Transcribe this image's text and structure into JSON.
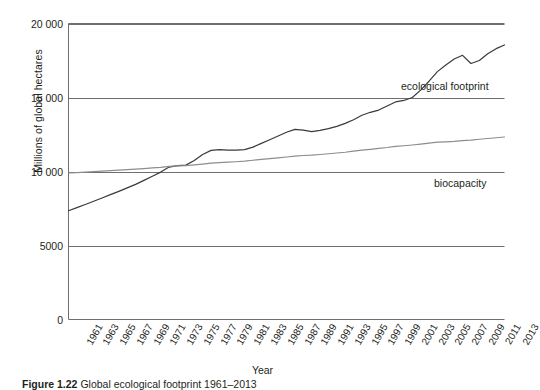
{
  "figure": {
    "caption_prefix": "Figure 1.22",
    "caption_text": "Global ecological footprint 1961–2013",
    "background": "#ffffff"
  },
  "chart_data": {
    "type": "line",
    "title": "",
    "xlabel": "Year",
    "ylabel": "Millions of global hectares",
    "xlim": [
      1961,
      2013
    ],
    "ylim": [
      0,
      20000
    ],
    "grid": true,
    "grid_axis": "y",
    "legend": "inline-annotations",
    "yticks": [
      "0",
      "5000",
      "10 000",
      "15 000",
      "20 000"
    ],
    "ytick_values": [
      0,
      5000,
      10000,
      15000,
      20000
    ],
    "categories": [
      1961,
      1963,
      1965,
      1967,
      1969,
      1971,
      1973,
      1975,
      1977,
      1979,
      1981,
      1983,
      1985,
      1987,
      1989,
      1991,
      1993,
      1995,
      1997,
      1999,
      2001,
      2003,
      2005,
      2007,
      2009,
      2011,
      2013
    ],
    "xtick_labels": [
      "1961",
      "1963",
      "1965",
      "1967",
      "1969",
      "1971",
      "1973",
      "1975",
      "1977",
      "1979",
      "1981",
      "1983",
      "1985",
      "1987",
      "1989",
      "1991",
      "1993",
      "1995",
      "1997",
      "1999",
      "2001",
      "2003",
      "2005",
      "2007",
      "2009",
      "2011",
      "2013"
    ],
    "series": [
      {
        "name": "ecological footprint",
        "color": "#3a3a3a",
        "annotation": "ecological footprint",
        "x": [
          1961,
          1962,
          1963,
          1964,
          1965,
          1966,
          1967,
          1968,
          1969,
          1970,
          1971,
          1972,
          1973,
          1974,
          1975,
          1976,
          1977,
          1978,
          1979,
          1980,
          1981,
          1982,
          1983,
          1984,
          1985,
          1986,
          1987,
          1988,
          1989,
          1990,
          1991,
          1992,
          1993,
          1994,
          1995,
          1996,
          1997,
          1998,
          1999,
          2000,
          2001,
          2002,
          2003,
          2004,
          2005,
          2006,
          2007,
          2008,
          2009,
          2010,
          2011,
          2012,
          2013
        ],
        "values": [
          7350,
          7560,
          7770,
          7990,
          8210,
          8440,
          8660,
          8890,
          9130,
          9400,
          9680,
          9960,
          10300,
          10400,
          10430,
          10750,
          11150,
          11430,
          11480,
          11450,
          11450,
          11480,
          11650,
          11900,
          12150,
          12400,
          12650,
          12850,
          12800,
          12700,
          12780,
          12900,
          13050,
          13250,
          13500,
          13800,
          14000,
          14150,
          14420,
          14700,
          14800,
          15000,
          15500,
          16100,
          16750,
          17200,
          17600,
          17850,
          17300,
          17500,
          17950,
          18300,
          18550
        ]
      },
      {
        "name": "biocapacity",
        "color": "#8d8d8d",
        "annotation": "biocapacity",
        "x": [
          1961,
          1962,
          1963,
          1964,
          1965,
          1966,
          1967,
          1968,
          1969,
          1970,
          1971,
          1972,
          1973,
          1974,
          1975,
          1976,
          1977,
          1978,
          1979,
          1980,
          1981,
          1982,
          1983,
          1984,
          1985,
          1986,
          1987,
          1988,
          1989,
          1990,
          1991,
          1992,
          1993,
          1994,
          1995,
          1996,
          1997,
          1998,
          1999,
          2000,
          2001,
          2002,
          2003,
          2004,
          2005,
          2006,
          2007,
          2008,
          2009,
          2010,
          2011,
          2012,
          2013
        ],
        "values": [
          9900,
          9930,
          9960,
          9990,
          10020,
          10060,
          10090,
          10120,
          10160,
          10200,
          10240,
          10280,
          10340,
          10380,
          10400,
          10450,
          10500,
          10560,
          10600,
          10630,
          10660,
          10700,
          10760,
          10820,
          10870,
          10920,
          10980,
          11040,
          11080,
          11100,
          11150,
          11200,
          11250,
          11300,
          11380,
          11440,
          11500,
          11560,
          11620,
          11700,
          11740,
          11790,
          11850,
          11920,
          11980,
          12000,
          12030,
          12080,
          12120,
          12180,
          12230,
          12280,
          12330
        ]
      }
    ]
  },
  "axes": {
    "frame_color": "#6e6e6e",
    "gridline_color": "#6e6e6e"
  }
}
